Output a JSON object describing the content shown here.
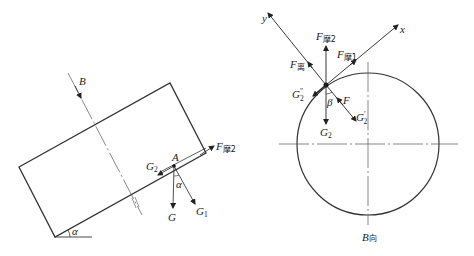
{
  "left_diagram": {
    "labels": {
      "B": "B",
      "A": "A",
      "G": "G",
      "G1_main": "G",
      "G1_sub": "1",
      "G2_main": "G",
      "G2_sub": "2",
      "Ffric2_main": "F",
      "Ffric2_sub": "摩2",
      "alpha_inner": "α",
      "alpha_base": "α"
    }
  },
  "right_diagram": {
    "labels": {
      "y": "y",
      "x": "x",
      "Ffric2_main": "F",
      "Ffric2_sub": "摩2",
      "Ffric1_main": "F",
      "Ffric1_sub": "摩1",
      "Fcent_main": "F",
      "Fcent_sub": "离",
      "G2pp_main": "G",
      "G2pp_sup": "″",
      "G2pp_sub": "2",
      "beta": "β",
      "F": "F",
      "G2p_main": "G",
      "G2p_sup": "′",
      "G2p_sub": "2",
      "G2_main": "G",
      "G2_sub": "2",
      "view_B_main": "B",
      "view_B_suffix": "向"
    }
  },
  "colors": {
    "line": "#333333",
    "thin_line": "#555555",
    "background": "#ffffff"
  }
}
